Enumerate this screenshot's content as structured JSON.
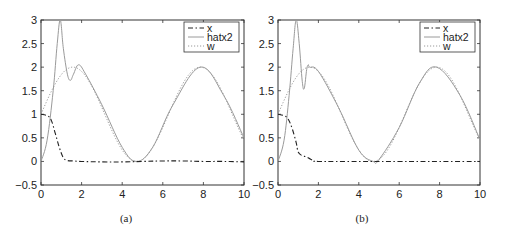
{
  "chart_data": [
    {
      "type": "line",
      "caption": "(a)",
      "title": "",
      "xlabel": "",
      "ylabel": "",
      "xlim": [
        0,
        10
      ],
      "ylim": [
        -0.5,
        3
      ],
      "xticks": [
        0,
        2,
        4,
        6,
        8,
        10
      ],
      "yticks": [
        -0.5,
        0,
        0.5,
        1,
        1.5,
        2,
        2.5,
        3
      ],
      "ytick_labels": [
        "-0.5",
        "0",
        "0.5",
        "1",
        "1.5",
        "2",
        "2.5",
        "3"
      ],
      "grid": false,
      "legend_position": "upper right",
      "series": [
        {
          "name": "x",
          "style": "dash-dot",
          "color": "#222222",
          "x": [
            0,
            0.3,
            0.5,
            0.7,
            0.9,
            1.1,
            1.3,
            1.6,
            2,
            3,
            4,
            5,
            6,
            7,
            8,
            9,
            10
          ],
          "y": [
            1,
            0.97,
            0.88,
            0.6,
            0.3,
            0.08,
            0.02,
            0.01,
            0,
            -0.01,
            -0.01,
            0,
            0.01,
            0.01,
            0,
            0,
            -0.01
          ]
        },
        {
          "name": "hatx2",
          "style": "solid",
          "color": "#9a9a9a",
          "x": [
            0,
            0.3,
            0.6,
            0.8,
            0.95,
            1.1,
            1.3,
            1.45,
            1.6,
            1.85,
            2.2,
            3,
            4,
            4.71,
            5.5,
            6.5,
            7.85,
            9,
            10
          ],
          "y": [
            0,
            0.45,
            1.5,
            2.5,
            3.0,
            2.4,
            1.85,
            1.72,
            1.85,
            2.05,
            1.85,
            1.2,
            0.3,
            0.0,
            0.3,
            1.2,
            2.0,
            1.4,
            0.5
          ]
        },
        {
          "name": "w",
          "style": "dotted",
          "color": "#9a9a9a",
          "formula": "1+sin(x)",
          "x": [
            0,
            1,
            1.57,
            2,
            3,
            4,
            4.71,
            5,
            6,
            7,
            7.85,
            8,
            9,
            10
          ],
          "y": [
            1,
            1.84,
            2.0,
            1.91,
            1.14,
            0.24,
            0.0,
            0.04,
            0.72,
            1.66,
            2.0,
            1.99,
            1.41,
            0.46
          ]
        }
      ]
    },
    {
      "type": "line",
      "caption": "(b)",
      "title": "",
      "xlabel": "",
      "ylabel": "",
      "xlim": [
        0,
        10
      ],
      "ylim": [
        -0.5,
        3
      ],
      "xticks": [
        0,
        2,
        4,
        6,
        8,
        10
      ],
      "yticks": [
        -0.5,
        0,
        0.5,
        1,
        1.5,
        2,
        2.5,
        3
      ],
      "ytick_labels": [
        "-0.5",
        "0",
        "0.5",
        "1",
        "1.5",
        "2",
        "2.5",
        "3"
      ],
      "grid": false,
      "legend_position": "upper right",
      "series": [
        {
          "name": "x",
          "style": "dash-dot",
          "color": "#222222",
          "x": [
            0,
            0.3,
            0.5,
            0.7,
            0.9,
            1.0,
            1.2,
            1.4,
            1.6,
            1.8,
            2,
            4,
            6,
            8,
            10
          ],
          "y": [
            1,
            0.97,
            0.9,
            0.7,
            0.4,
            0.2,
            0.12,
            0.1,
            0.05,
            0.01,
            0,
            0,
            0,
            0,
            0
          ]
        },
        {
          "name": "hatx2",
          "style": "solid",
          "color": "#9a9a9a",
          "x": [
            0,
            0.3,
            0.55,
            0.75,
            0.9,
            1.05,
            1.2,
            1.3,
            1.42,
            1.5,
            1.57,
            2,
            3,
            4,
            4.71,
            5,
            6,
            7,
            7.85,
            9,
            10
          ],
          "y": [
            0,
            0.45,
            1.4,
            2.4,
            3.0,
            2.5,
            1.7,
            1.55,
            1.95,
            2.05,
            2.0,
            1.91,
            1.14,
            0.24,
            0.0,
            0.04,
            0.72,
            1.66,
            2.0,
            1.41,
            0.46
          ]
        },
        {
          "name": "w",
          "style": "dotted",
          "color": "#9a9a9a",
          "formula": "1+sin(x)",
          "x": [
            0,
            1,
            1.57,
            2,
            3,
            4,
            4.71,
            5,
            6,
            7,
            7.85,
            8,
            9,
            10
          ],
          "y": [
            1,
            1.84,
            2.0,
            1.91,
            1.14,
            0.24,
            0.0,
            0.04,
            0.72,
            1.66,
            2.0,
            1.99,
            1.41,
            0.46
          ]
        }
      ]
    }
  ]
}
